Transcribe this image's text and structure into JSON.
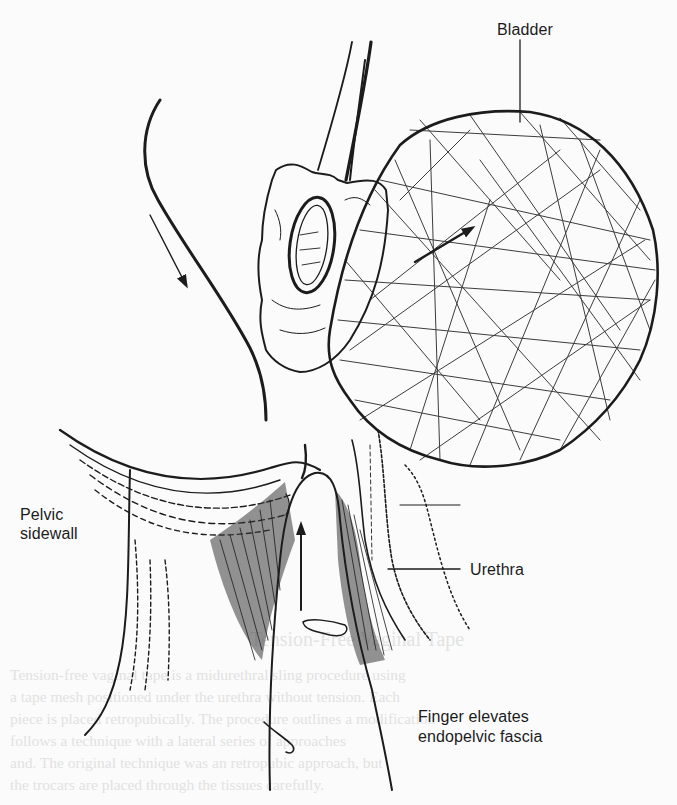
{
  "figure": {
    "type": "anatomical line illustration",
    "labels": {
      "bladder": "Bladder",
      "pelvic_sidewall_line1": "Pelvic",
      "pelvic_sidewall_line2": "sidewall",
      "urethra": "Urethra",
      "finger_line1": "Finger elevates",
      "finger_line2": "endopelvic fascia"
    },
    "arrows": [
      {
        "name": "downward-arrow",
        "direction": "down-right"
      },
      {
        "name": "bladder-arrow",
        "direction": "up-right"
      },
      {
        "name": "finger-arrow",
        "direction": "up"
      }
    ],
    "colors": {
      "ink": "#1c1c1c",
      "paper": "#fbfbfb",
      "bleed_through": "#d9d9d9"
    }
  },
  "bleed_through_text": {
    "heading": "Tension-Free Vaginal Tape",
    "lines": [
      "Tension-free vaginal tape is a midurethral sling procedure using",
      "a tape mesh positioned under the urethra without tension. Each",
      "piece is placed retropubically. The procedure outlines a modification",
      "follows a technique with a lateral series of approaches",
      "and. The original technique was an retropubic approach, but",
      "the trocars are placed through the tissues carefully."
    ]
  }
}
